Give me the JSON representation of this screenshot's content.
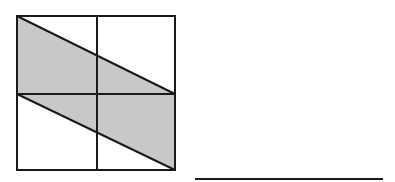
{
  "figure": {
    "colors": {
      "stroke": "#1a1a1a",
      "shade": "#c8c8c8",
      "background": "#ffffff"
    }
  },
  "answer_line": {
    "text": ""
  }
}
